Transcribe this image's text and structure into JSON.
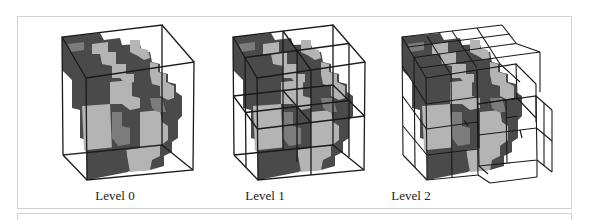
{
  "figure": {
    "panels": [
      {
        "label": "Level 0",
        "subdivisions": 1
      },
      {
        "label": "Level 1",
        "subdivisions": 2
      },
      {
        "label": "Level 2",
        "subdivisions": 4
      }
    ],
    "colors": {
      "dark_voxel": "#4a4a4a",
      "light_voxel": "#b4b4b4",
      "mid_voxel": "#7c7c7c",
      "wireframe": "#1a1a1a",
      "frame_border": "#d2d2d2"
    }
  }
}
